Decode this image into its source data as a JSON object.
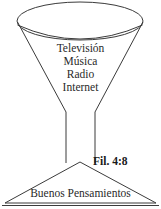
{
  "diagram": {
    "stroke_color": "#3b3b3b",
    "background_color": "#ffffff",
    "text_color": "#2a2a2a",
    "funnel": {
      "name": "funnel",
      "rim_label": "funnel-rim-ellipse",
      "cone_label": "funnel-cone",
      "stem_label": "funnel-stem"
    },
    "inflow_items": [
      {
        "label": "Televisión"
      },
      {
        "label": "Música"
      },
      {
        "label": "Radio"
      },
      {
        "label": "Internet"
      }
    ],
    "outcome": {
      "label": "Buenos Pensamientos",
      "shape": "triangle-base"
    },
    "verse": {
      "reference": "Fil. 4:8"
    }
  }
}
